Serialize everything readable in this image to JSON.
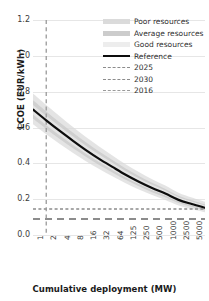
{
  "chart_data": {
    "type": "line",
    "title": "",
    "xlabel": "Cumulative deployment (MW)",
    "ylabel": "LCOE (EUR/kWh)",
    "xticklabels": [
      "1",
      "2",
      "4",
      "8",
      "16",
      "32",
      "64",
      "125",
      "250",
      "500",
      "1000",
      "2500",
      "5000",
      "10000"
    ],
    "yticklabels": [
      "0.0",
      "0.2",
      "0.4",
      "0.6",
      "0.8",
      "1.0",
      "1.2"
    ],
    "ylim": [
      0.0,
      1.2
    ],
    "ytick_step": 0.2,
    "grid": "horizontal",
    "legend_position": "top-right",
    "x": [
      1,
      2,
      4,
      8,
      16,
      32,
      64,
      125,
      250,
      500,
      1000,
      2500,
      5000,
      10000
    ],
    "series": [
      {
        "name": "Reference",
        "style": "solid",
        "color": "#0d0d0d",
        "values": [
          0.7,
          0.64,
          0.582,
          0.527,
          0.474,
          0.425,
          0.38,
          0.336,
          0.297,
          0.262,
          0.231,
          0.196,
          0.173,
          0.152
        ]
      },
      {
        "name": "Poor resources",
        "style": "band",
        "color": "#d9d9d9",
        "band_upper": [
          0.79,
          0.726,
          0.664,
          0.604,
          0.547,
          0.494,
          0.444,
          0.395,
          0.351,
          0.311,
          0.276,
          0.236,
          0.209,
          0.185
        ],
        "band_lower": [
          0.618,
          0.562,
          0.509,
          0.459,
          0.412,
          0.368,
          0.328,
          0.289,
          0.254,
          0.223,
          0.196,
          0.165,
          0.145,
          0.127
        ]
      },
      {
        "name": "Average resources",
        "style": "band",
        "color": "#c7c7c7",
        "band_upper": [
          0.752,
          0.69,
          0.63,
          0.572,
          0.517,
          0.466,
          0.418,
          0.371,
          0.329,
          0.291,
          0.257,
          0.219,
          0.194,
          0.171
        ],
        "band_lower": [
          0.65,
          0.592,
          0.537,
          0.485,
          0.437,
          0.391,
          0.349,
          0.308,
          0.272,
          0.239,
          0.211,
          0.178,
          0.157,
          0.138
        ]
      },
      {
        "name": "Good resources",
        "style": "band",
        "color": "#ececec",
        "band_upper": [
          0.726,
          0.665,
          0.607,
          0.551,
          0.498,
          0.449,
          0.403,
          0.357,
          0.317,
          0.28,
          0.248,
          0.211,
          0.187,
          0.165
        ],
        "band_lower": [
          0.672,
          0.613,
          0.557,
          0.504,
          0.454,
          0.407,
          0.363,
          0.321,
          0.284,
          0.25,
          0.221,
          0.187,
          0.165,
          0.145
        ]
      }
    ],
    "reference_lines": [
      {
        "name": "2025",
        "orientation": "horizontal",
        "value": 0.145,
        "style": "dashed",
        "color": "#8c8c8c"
      },
      {
        "name": "2030",
        "orientation": "horizontal",
        "value": 0.09,
        "style": "long-dashed",
        "color": "#8c8c8c"
      },
      {
        "name": "2016",
        "orientation": "vertical",
        "value": 2,
        "style": "dashed",
        "color": "#9a9a9a"
      }
    ]
  },
  "legend": {
    "items": [
      {
        "label": "Poor resources",
        "key": "band-swatch-poor"
      },
      {
        "label": "Average resources",
        "key": "band-swatch-average"
      },
      {
        "label": "Good resources",
        "key": "band-swatch-good"
      },
      {
        "label": "Reference",
        "key": "solid-line-swatch"
      },
      {
        "label": "2025",
        "key": "dashed-line-swatch-2025"
      },
      {
        "label": "2030",
        "key": "dashed-line-swatch-2030"
      },
      {
        "label": "2016",
        "key": "dashed-line-swatch-2016"
      }
    ]
  }
}
